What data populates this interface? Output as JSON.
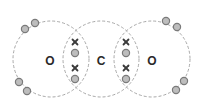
{
  "diagram": {
    "type": "dot-and-cross",
    "molecule": "carbon dioxide",
    "atoms": [
      {
        "symbol": "O",
        "cx": 51,
        "cy": 59,
        "r": 38
      },
      {
        "symbol": "C",
        "cx": 101,
        "cy": 59,
        "r": 38
      },
      {
        "symbol": "O",
        "cx": 152,
        "cy": 59,
        "r": 38
      }
    ],
    "labels": {
      "left_oxygen": "O",
      "carbon": "C",
      "right_oxygen": "O"
    },
    "colors": {
      "shell": "#a8a8a8",
      "electron_fill": "#bdbdbd",
      "electron_stroke": "#7a7a7a",
      "cross": "#3c3c3c",
      "label": "#2a2a2a"
    },
    "oxygen_lone_pair_electrons": [
      {
        "x": 25,
        "y": 29
      },
      {
        "x": 35,
        "y": 23
      },
      {
        "x": 19,
        "y": 82
      },
      {
        "x": 27,
        "y": 91
      },
      {
        "x": 166,
        "y": 21
      },
      {
        "x": 177,
        "y": 27
      },
      {
        "x": 184,
        "y": 81
      },
      {
        "x": 176,
        "y": 90
      }
    ],
    "bonds": [
      {
        "name": "left double bond",
        "oxygen_electrons": [
          {
            "x": 75,
            "y": 53
          },
          {
            "x": 75,
            "y": 79
          }
        ],
        "carbon_electrons_cross": [
          {
            "x": 75,
            "y": 42
          },
          {
            "x": 75,
            "y": 68
          }
        ]
      },
      {
        "name": "right double bond",
        "oxygen_electrons": [
          {
            "x": 126,
            "y": 53
          },
          {
            "x": 126,
            "y": 79
          }
        ],
        "carbon_electrons_cross": [
          {
            "x": 126,
            "y": 42
          },
          {
            "x": 126,
            "y": 68
          }
        ]
      }
    ]
  }
}
